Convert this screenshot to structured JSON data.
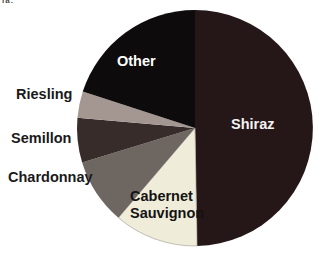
{
  "corner_text_fragment": "ia.",
  "chart_data": {
    "type": "pie",
    "title": "",
    "legend": "none",
    "label_style": "direct-on-or-beside-slices",
    "background_color": "#ffffff",
    "slices": [
      {
        "id": "shiraz",
        "label": "Shiraz",
        "percent": 49.7,
        "start_deg": 0,
        "end_deg": 179,
        "color": "#251617",
        "label_color": "#f4f2f2",
        "label_placement": "inside"
      },
      {
        "id": "cabernet-sauvignon",
        "label": "Cabernet Sauvignon",
        "percent": 11.6,
        "start_deg": 179,
        "end_deg": 220.5,
        "color": "#f0ecda",
        "stroke": "#a9a598",
        "label_color": "#131313",
        "label_placement": "inside"
      },
      {
        "id": "chardonnay",
        "label": "Chardonnay",
        "percent": 9.0,
        "start_deg": 220.5,
        "end_deg": 253,
        "color": "#6e6661",
        "label_color": "#1a1a1a",
        "label_placement": "outside-left"
      },
      {
        "id": "semillon",
        "label": "Semillon",
        "percent": 6.1,
        "start_deg": 253,
        "end_deg": 275,
        "color": "#382c2b",
        "label_color": "#1a1a1a",
        "label_placement": "outside-left"
      },
      {
        "id": "riesling",
        "label": "Riesling",
        "percent": 3.6,
        "start_deg": 275,
        "end_deg": 288,
        "color": "#a49792",
        "label_color": "#1a1a1a",
        "label_placement": "outside-left"
      },
      {
        "id": "other",
        "label": "Other",
        "percent": 20.0,
        "start_deg": 288,
        "end_deg": 360,
        "color": "#0d0b0b",
        "label_color": "#ffffff",
        "label_placement": "inside"
      }
    ]
  }
}
